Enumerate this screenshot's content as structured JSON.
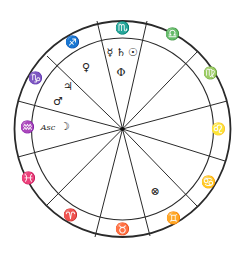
{
  "chart": {
    "title": "",
    "type": "natal-wheel",
    "center": {
      "x": 122.5,
      "y": 129
    },
    "outer_radius": 108,
    "inner_radius": 91,
    "colors": {
      "line": "#2a2a2a",
      "glyph": "#222222",
      "background": "#ffffff"
    }
  },
  "cusps": [
    {
      "name": "sagittarius-scorpio",
      "x": 97,
      "y": 21
    },
    {
      "name": "scorpio-libra",
      "x": 147,
      "y": 21
    },
    {
      "name": "libra-virgo",
      "x": 198,
      "y": 51
    },
    {
      "name": "virgo-leo",
      "x": 227,
      "y": 101
    },
    {
      "name": "leo-cancer",
      "x": 225,
      "y": 161
    },
    {
      "name": "cancer-gemini",
      "x": 197,
      "y": 206
    },
    {
      "name": "gemini-taurus",
      "x": 150,
      "y": 236
    },
    {
      "name": "taurus-aries",
      "x": 95,
      "y": 237
    },
    {
      "name": "aries-pisces",
      "x": 46,
      "y": 206
    },
    {
      "name": "pisces-aquarius",
      "x": 18,
      "y": 157
    },
    {
      "name": "aquarius-capricorn",
      "x": 18,
      "y": 101
    },
    {
      "name": "capricorn-sagittarius",
      "x": 47,
      "y": 56
    }
  ],
  "signs": [
    {
      "name": "scorpio",
      "glyph": "♏",
      "x": 122,
      "y": 28
    },
    {
      "name": "libra",
      "glyph": "♎",
      "x": 172,
      "y": 34
    },
    {
      "name": "virgo",
      "glyph": "♍",
      "x": 210,
      "y": 73
    },
    {
      "name": "leo",
      "glyph": "♌",
      "x": 218,
      "y": 129
    },
    {
      "name": "cancer",
      "glyph": "♋",
      "x": 208,
      "y": 182
    },
    {
      "name": "gemini",
      "glyph": "♊",
      "x": 173,
      "y": 218
    },
    {
      "name": "taurus",
      "glyph": "♉",
      "x": 122,
      "y": 229
    },
    {
      "name": "aries",
      "glyph": "♈",
      "x": 70,
      "y": 215
    },
    {
      "name": "pisces",
      "glyph": "♓",
      "x": 28,
      "y": 178
    },
    {
      "name": "aquarius",
      "glyph": "♒",
      "x": 27,
      "y": 127
    },
    {
      "name": "capricorn",
      "glyph": "♑",
      "x": 35,
      "y": 78
    },
    {
      "name": "sagittarius",
      "glyph": "♐",
      "x": 72,
      "y": 42
    }
  ],
  "bodies": [
    {
      "name": "mercury",
      "glyph": "☿",
      "x": 110,
      "y": 52
    },
    {
      "name": "saturn",
      "glyph": "♄",
      "x": 121,
      "y": 52
    },
    {
      "name": "sun",
      "glyph": "☉",
      "x": 133,
      "y": 52
    },
    {
      "name": "earth",
      "glyph": "Φ",
      "x": 121,
      "y": 72
    },
    {
      "name": "venus",
      "glyph": "♀",
      "x": 86,
      "y": 67
    },
    {
      "name": "jupiter",
      "glyph": "♃",
      "x": 68,
      "y": 86
    },
    {
      "name": "mars",
      "glyph": "♂",
      "x": 58,
      "y": 101
    },
    {
      "name": "moon",
      "glyph": "☽",
      "x": 65,
      "y": 126
    },
    {
      "name": "part-of-fortune",
      "glyph": "⊗",
      "x": 155,
      "y": 191
    }
  ],
  "ascendant": {
    "label": "Asc",
    "x": 48,
    "y": 127
  }
}
